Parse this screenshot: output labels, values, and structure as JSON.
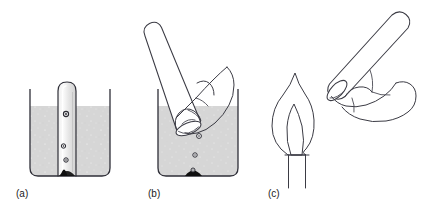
{
  "figure": {
    "background_color": "#ffffff",
    "ink_color": "#2f2f38",
    "liquid_color": "#d4d4d4",
    "solid_color": "#111111",
    "panel_count": 3
  },
  "panels": [
    {
      "id": "a",
      "label": "(a)",
      "caption": "Inverted test tube full of water standing in a beaker over the reacting solid; gas bubbles rise and collect at the closed top of the tube.",
      "elements": {
        "beaker": "beaker",
        "liquid": "water",
        "tube": "inverted-test-tube",
        "solid": "black-solid-reactant",
        "bubbles": 3
      },
      "bubble_positions": [
        {
          "x": 66,
          "y": 114,
          "r": 2.6
        },
        {
          "x": 63,
          "y": 146,
          "r": 2.2
        },
        {
          "x": 66,
          "y": 160,
          "r": 2.2
        }
      ]
    },
    {
      "id": "b",
      "label": "(b)",
      "caption": "A hand grips the filled test tube, thumb sealing its mouth, and lifts it mouth-downwards out of the water while bubbles continue to rise from the solid.",
      "elements": {
        "beaker": "beaker",
        "liquid": "water",
        "tube": "tilted-test-tube",
        "hand": "hand-gripping-tube",
        "solid": "black-solid-reactant",
        "bubbles": 3
      },
      "bubble_positions": [
        {
          "x": 199,
          "y": 136,
          "r": 2.4
        },
        {
          "x": 195,
          "y": 155,
          "r": 2.2
        },
        {
          "x": 193,
          "y": 174,
          "r": 2.2
        }
      ]
    },
    {
      "id": "c",
      "label": "(c)",
      "caption": "The tube of collected gas is brought mouth-downwards to a lighted splint or burner flame to test the gas.",
      "elements": {
        "flame": "burner-flame",
        "burner": "burner-tube",
        "tube": "tilted-test-tube",
        "hand": "hand-gripping-tube",
        "flame_cones": 2
      }
    }
  ],
  "labels": {
    "a": "(a)",
    "b": "(b)",
    "c": "(c)"
  }
}
